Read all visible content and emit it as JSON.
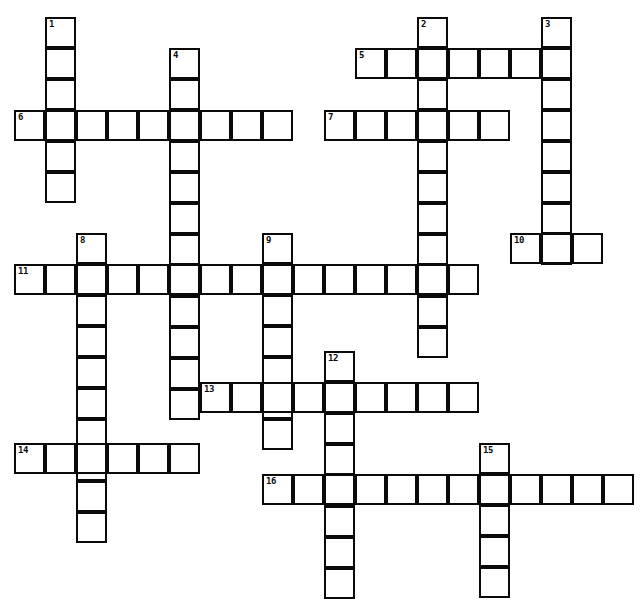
{
  "puzzle": {
    "title": "Crossword Grid",
    "cell_size": 31,
    "grid_origin": {
      "x": 14,
      "y": 17
    },
    "colors": {
      "background": "#ffffff",
      "cell_fill": "#ffffff",
      "cell_border": "#0a0a0a",
      "number_text": "#0a0a0a"
    },
    "entries": [
      {
        "number": "1",
        "direction": "down",
        "col": 1,
        "row": 0,
        "length": 6,
        "x": 45,
        "y": 17
      },
      {
        "number": "2",
        "direction": "down",
        "col": 13,
        "row": 0,
        "length": 11,
        "x": 417,
        "y": 17
      },
      {
        "number": "3",
        "direction": "down",
        "col": 17,
        "row": 0,
        "length": 8,
        "x": 541,
        "y": 17
      },
      {
        "number": "4",
        "direction": "down",
        "col": 5,
        "row": 1,
        "length": 12,
        "x": 169,
        "y": 48
      },
      {
        "number": "5",
        "direction": "across",
        "col": 11,
        "row": 1,
        "length": 7,
        "x": 355,
        "y": 48
      },
      {
        "number": "6",
        "direction": "across",
        "col": 0,
        "row": 3,
        "length": 9,
        "x": 14,
        "y": 110
      },
      {
        "number": "7",
        "direction": "across",
        "col": 10,
        "row": 3,
        "length": 6,
        "x": 324,
        "y": 110
      },
      {
        "number": "8",
        "direction": "down",
        "col": 2,
        "row": 7,
        "length": 10,
        "x": 76,
        "y": 233
      },
      {
        "number": "9",
        "direction": "down",
        "col": 8,
        "row": 7,
        "length": 7,
        "x": 262,
        "y": 233
      },
      {
        "number": "10",
        "direction": "across",
        "col": 16,
        "row": 7,
        "length": 3,
        "x": 510,
        "y": 233
      },
      {
        "number": "11",
        "direction": "across",
        "col": 0,
        "row": 8,
        "length": 15,
        "x": 14,
        "y": 264
      },
      {
        "number": "12",
        "direction": "down",
        "col": 10,
        "row": 11,
        "length": 8,
        "x": 324,
        "y": 351
      },
      {
        "number": "13",
        "direction": "across",
        "col": 6,
        "row": 12,
        "length": 9,
        "x": 200,
        "y": 382
      },
      {
        "number": "14",
        "direction": "across",
        "col": 0,
        "row": 14,
        "length": 6,
        "x": 14,
        "y": 443
      },
      {
        "number": "15",
        "direction": "down",
        "col": 15,
        "row": 14,
        "length": 5,
        "x": 479,
        "y": 443
      },
      {
        "number": "16",
        "direction": "across",
        "col": 8,
        "row": 15,
        "length": 12,
        "x": 262,
        "y": 474
      }
    ]
  }
}
